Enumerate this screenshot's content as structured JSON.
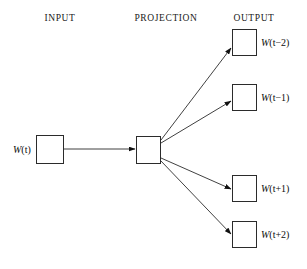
{
  "figure": {
    "width": 307,
    "height": 269,
    "background": "#ffffff",
    "stroke_color": "#2b2b2b",
    "text_color": "#0d0d0d"
  },
  "columns": {
    "input": {
      "label": "INPUT",
      "x": 60,
      "y": 14
    },
    "projection": {
      "label": "PROJECTION",
      "x": 166,
      "y": 14
    },
    "output": {
      "label": "OUTPUT",
      "x": 254,
      "y": 14
    }
  },
  "nodes": {
    "input": {
      "label_var": "W",
      "label_arg": "(t)",
      "label_full": "W(t)",
      "box": {
        "x": 36,
        "y": 135,
        "w": 28,
        "h": 29
      },
      "label_pos": {
        "x": 13,
        "y": 145
      }
    },
    "projection": {
      "label_full": "",
      "box": {
        "x": 136,
        "y": 136,
        "w": 25,
        "h": 28
      }
    },
    "outputs": [
      {
        "label_var": "W",
        "label_arg": "(t−2)",
        "label_full": "W(t−2)",
        "box": {
          "x": 232,
          "y": 29,
          "w": 25,
          "h": 27
        },
        "label_pos": {
          "x": 261,
          "y": 38
        }
      },
      {
        "label_var": "W",
        "label_arg": "(t−1)",
        "label_full": "W(t−1)",
        "box": {
          "x": 232,
          "y": 84,
          "w": 25,
          "h": 27
        },
        "label_pos": {
          "x": 261,
          "y": 93
        }
      },
      {
        "label_var": "W",
        "label_arg": "(t+1)",
        "label_full": "W(t+1)",
        "box": {
          "x": 232,
          "y": 175,
          "w": 25,
          "h": 27
        },
        "label_pos": {
          "x": 261,
          "y": 184
        }
      },
      {
        "label_var": "W",
        "label_arg": "(t+2)",
        "label_full": "W(t+2)",
        "box": {
          "x": 232,
          "y": 221,
          "w": 25,
          "h": 27
        },
        "label_pos": {
          "x": 261,
          "y": 230
        }
      }
    ]
  },
  "edges": [
    {
      "name": "input-to-projection",
      "x1": 64,
      "y1": 149,
      "x2": 135,
      "y2": 149
    },
    {
      "name": "projection-to-output-1",
      "x1": 161,
      "y1": 140,
      "x2": 231,
      "y2": 48
    },
    {
      "name": "projection-to-output-2",
      "x1": 161,
      "y1": 143,
      "x2": 231,
      "y2": 101
    },
    {
      "name": "projection-to-output-3",
      "x1": 161,
      "y1": 158,
      "x2": 231,
      "y2": 189
    },
    {
      "name": "projection-to-output-4",
      "x1": 161,
      "y1": 161,
      "x2": 231,
      "y2": 234
    }
  ]
}
